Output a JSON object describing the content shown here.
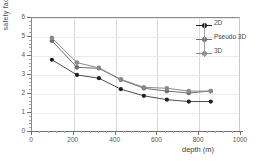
{
  "chart_data": {
    "type": "line",
    "title": "",
    "xlabel": "depth (m)",
    "ylabel": "safety factor",
    "xlim": [
      0,
      1000
    ],
    "ylim": [
      0,
      6
    ],
    "xticks": [
      0,
      200,
      400,
      600,
      800,
      1000
    ],
    "yticks": [
      0,
      1,
      2,
      3,
      4,
      5,
      6
    ],
    "grid": true,
    "legend_position": "top-right",
    "x": [
      100,
      220,
      325,
      430,
      540,
      650,
      755,
      860
    ],
    "series": [
      {
        "name": "2D",
        "color": "#1f1f1f",
        "marker": "circle",
        "values": [
          3.75,
          2.95,
          2.78,
          2.2,
          1.85,
          1.65,
          1.55,
          1.55
        ]
      },
      {
        "name": "Pseudo 3D",
        "color": "#6e6e6e",
        "marker": "circle",
        "values": [
          4.75,
          3.35,
          3.3,
          2.7,
          2.25,
          2.1,
          2.0,
          2.1
        ]
      },
      {
        "name": "3D",
        "color": "#8a8a8a",
        "marker": "circle",
        "values": [
          4.9,
          3.6,
          3.32,
          2.72,
          2.3,
          2.25,
          2.1,
          2.1
        ]
      }
    ]
  },
  "axes": {
    "y_title": "safety factor",
    "x_title": "depth (m)",
    "y_tick_labels": [
      "0",
      "1",
      "2",
      "3",
      "4",
      "5",
      "6"
    ],
    "x_tick_labels": [
      "0",
      "200",
      "400",
      "600",
      "800",
      "1000"
    ]
  },
  "legend": {
    "entries": [
      {
        "label": "2D"
      },
      {
        "label": "Pseudo 3D"
      },
      {
        "label": "3D"
      }
    ]
  }
}
